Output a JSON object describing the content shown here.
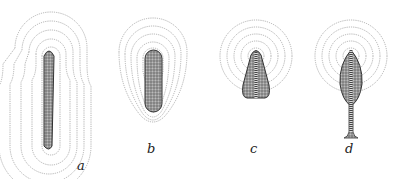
{
  "figure": {
    "panels": [
      {
        "id": "a",
        "label": "a",
        "shape": "long rod",
        "contours": 5
      },
      {
        "id": "b",
        "label": "b",
        "shape": "short rounded rod",
        "contours": 5
      },
      {
        "id": "c",
        "label": "c",
        "shape": "tapered block with central stripe",
        "contours": 5
      },
      {
        "id": "d",
        "label": "d",
        "shape": "leaf on stalk with central stripe",
        "contours": 5
      }
    ]
  },
  "colors": {
    "contour": "#9a9a9a",
    "body": "#8a8a8a",
    "body_edge": "#333333"
  }
}
